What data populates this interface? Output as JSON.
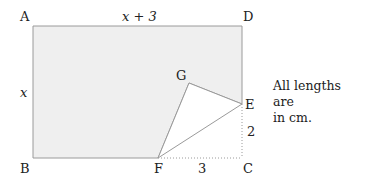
{
  "diagram": {
    "labels": {
      "A": "A",
      "B": "B",
      "C": "C",
      "D": "D",
      "E": "E",
      "F": "F",
      "G": "G",
      "top_side": "x + 3",
      "left_side": "x",
      "ec_length": "2",
      "fc_length": "3"
    },
    "note_line1": "All lengths are",
    "note_line2": "in cm.",
    "colors": {
      "fill": "#efefef",
      "stroke": "#9a9a9a",
      "text": "#222222"
    }
  }
}
